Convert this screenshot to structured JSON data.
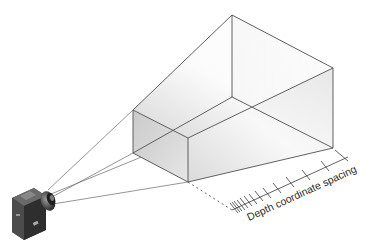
{
  "figure": {
    "axis_label": "Depth coordinate spacing",
    "colors": {
      "background": "#ffffff",
      "edge": "#555555",
      "face_dark": "#bdbdbd",
      "face_light": "#f4f4f4",
      "ray": "#777777",
      "camera_body": "#3a3a3a"
    },
    "frustum": {
      "near_face": [
        [
          133,
          110
        ],
        [
          188,
          138
        ],
        [
          188,
          182
        ],
        [
          133,
          153
        ]
      ],
      "far_face": [
        [
          232,
          15
        ],
        [
          333,
          68
        ],
        [
          333,
          148
        ],
        [
          232,
          97
        ]
      ]
    },
    "camera": {
      "position": [
        30,
        210
      ],
      "lens": [
        50,
        193
      ]
    },
    "depth_axis": {
      "start": [
        232,
        210
      ],
      "end": [
        348,
        157
      ],
      "tick_count": 13,
      "spacing": "non-uniform (denser near camera)"
    }
  }
}
